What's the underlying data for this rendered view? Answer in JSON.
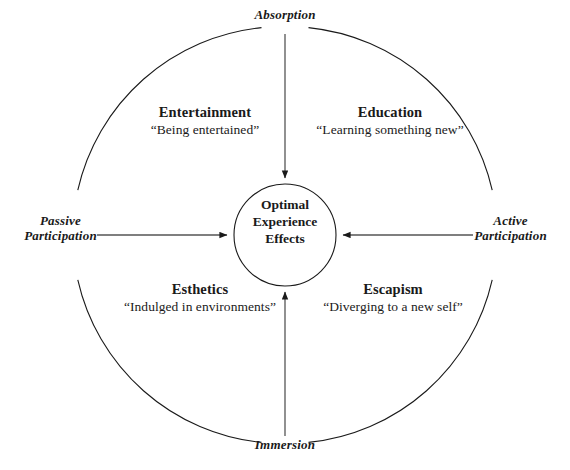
{
  "diagram": {
    "center": {
      "line1": "Optimal",
      "line2": "Experience",
      "line3": "Effects"
    },
    "axes": {
      "top": "Absorption",
      "bottom": "Immersion",
      "left_line1": "Passive",
      "left_line2": "Participation",
      "right_line1": "Active",
      "right_line2": "Participation"
    },
    "realms": [
      {
        "key": "entertainment",
        "title": "Entertainment",
        "description": "“Being entertained”"
      },
      {
        "key": "education",
        "title": "Education",
        "description": "“Learning something new”"
      },
      {
        "key": "esthetics",
        "title": "Esthetics",
        "description": "“Indulged in environments”"
      },
      {
        "key": "escapism",
        "title": "Escapism",
        "description": "“Diverging to a new self”"
      }
    ],
    "colors": {
      "stroke": "#1a1a1a",
      "text": "#1a1a1a",
      "background": "#ffffff"
    }
  }
}
